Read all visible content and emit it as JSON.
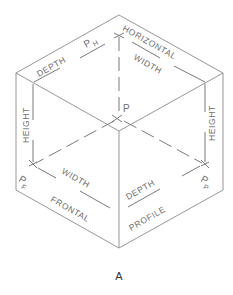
{
  "figure": {
    "caption": "A",
    "planes": {
      "horizontal": "HORIZONTAL",
      "frontal": "FRONTAL",
      "profile": "PROFILE"
    },
    "dimensions": {
      "depth_top": "DEPTH",
      "width_top": "WIDTH",
      "height_left": "HEIGHT",
      "height_right": "HEIGHT",
      "width_front": "WIDTH",
      "depth_profile": "DEPTH"
    },
    "points": {
      "p": "P",
      "ph_main": "P",
      "ph_sub": "H",
      "pf_main": "P",
      "pf_sub": "F",
      "pp_main": "P",
      "pp_sub": "P"
    },
    "colors": {
      "line": "#8a8a8a",
      "text": "#6e6e6e"
    }
  }
}
